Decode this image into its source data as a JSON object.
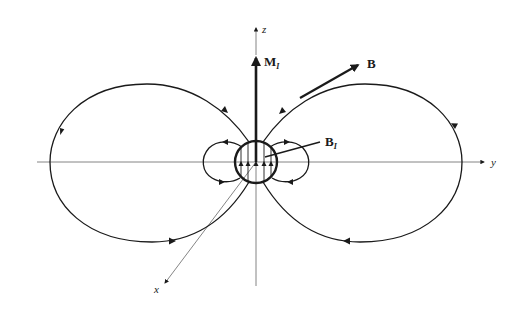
{
  "figure": {
    "colors": {
      "line": "#1a1a1a",
      "axis": "#777777",
      "background": "#ffffff"
    }
  },
  "axes": {
    "z_label": "z",
    "y_label": "y",
    "x_label": "x"
  },
  "vectors": {
    "magnetization": {
      "label": "M",
      "subscript": "I"
    },
    "external_field": {
      "label": "B",
      "subscript": ""
    },
    "internal_field": {
      "label": "B",
      "subscript": "I"
    }
  },
  "field_lines": {
    "outer_lobes": [
      "left",
      "right"
    ],
    "inner_lobes": [
      "left",
      "right"
    ],
    "internal_lines_count": 5
  }
}
